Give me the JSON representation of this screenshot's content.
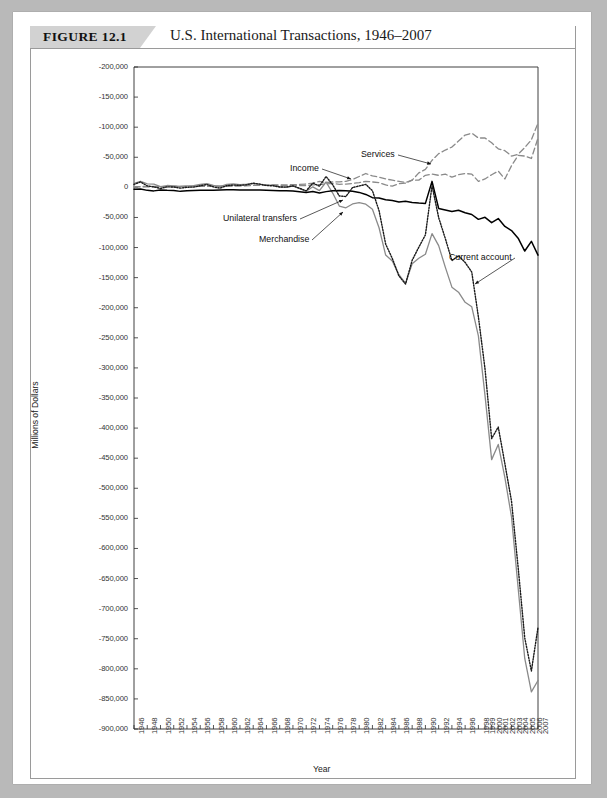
{
  "figure": {
    "tag": "FIGURE 12.1",
    "title": "U.S. International Transactions, 1946–2007"
  },
  "chart_data": {
    "type": "line",
    "title": "U.S. International Transactions, 1946–2007",
    "xlabel": "Year",
    "ylabel": "Millions of Dollars",
    "grid": false,
    "legend_position": "inline-annotations",
    "y_tick_labels": [
      "-200,000",
      "-150,000",
      "-100,000",
      "-50,000",
      "0",
      "-50,000",
      "-100,000",
      "-150,000",
      "-200,000",
      "-250,000",
      "-300,000",
      "-350,000",
      "-400,000",
      "-450,000",
      "-500,000",
      "-550,000",
      "-600,000",
      "-650,000",
      "-700,000",
      "-750,000",
      "-800,000",
      "-850,000",
      "-900,000"
    ],
    "y_tick_values": [
      200000,
      150000,
      100000,
      50000,
      0,
      -50000,
      -100000,
      -150000,
      -200000,
      -250000,
      -300000,
      -350000,
      -400000,
      -450000,
      -500000,
      -550000,
      -600000,
      -650000,
      -700000,
      -750000,
      -800000,
      -850000,
      -900000
    ],
    "ylim": [
      -900000,
      200000
    ],
    "x_tick_labels": [
      "1946",
      "1948",
      "1950",
      "1952",
      "1954",
      "1956",
      "1958",
      "1960",
      "1962",
      "1964",
      "1966",
      "1968",
      "1970",
      "1972",
      "1974",
      "1976",
      "1978",
      "1980",
      "1982",
      "1984",
      "1986",
      "1988",
      "1990",
      "1992",
      "1994",
      "1996",
      "1998",
      "1999",
      "2000",
      "2001",
      "2002",
      "2003",
      "2004",
      "2005",
      "2006",
      "2007"
    ],
    "x": [
      1946,
      1947,
      1948,
      1949,
      1950,
      1951,
      1952,
      1953,
      1954,
      1955,
      1956,
      1957,
      1958,
      1959,
      1960,
      1961,
      1962,
      1963,
      1964,
      1965,
      1966,
      1967,
      1968,
      1969,
      1970,
      1971,
      1972,
      1973,
      1974,
      1975,
      1976,
      1977,
      1978,
      1979,
      1980,
      1981,
      1982,
      1983,
      1984,
      1985,
      1986,
      1987,
      1988,
      1989,
      1990,
      1991,
      1992,
      1993,
      1994,
      1995,
      1996,
      1997,
      1998,
      1999,
      2000,
      2001,
      2002,
      2003,
      2004,
      2005,
      2006,
      2007
    ],
    "series": [
      {
        "name": "Merchandise",
        "style": "solid",
        "color": "#8a8a8a",
        "width": 1.3,
        "values": [
          6697,
          10124,
          5708,
          5339,
          1122,
          3067,
          2611,
          1437,
          2576,
          2897,
          4753,
          6271,
          3312,
          1148,
          4892,
          5571,
          4521,
          5224,
          6801,
          4951,
          3817,
          3800,
          635,
          607,
          2603,
          -2260,
          -6416,
          911,
          -5505,
          8903,
          -9483,
          -31091,
          -33927,
          -27568,
          -25500,
          -28023,
          -36485,
          -67102,
          -112492,
          -122173,
          -145081,
          -159557,
          -126959,
          -117749,
          -111037,
          -76937,
          -96897,
          -132451,
          -165831,
          -174170,
          -191000,
          -198428,
          -246687,
          -346000,
          -452414,
          -427172,
          -482287,
          -547553,
          -665390,
          -782804,
          -838271,
          -819373
        ]
      },
      {
        "name": "Services",
        "style": "dashed",
        "color": "#8a8a8a",
        "width": 1.3,
        "values": [
          1200,
          1400,
          1500,
          1400,
          1200,
          1300,
          1400,
          1500,
          1600,
          1700,
          1800,
          2000,
          2000,
          2100,
          2300,
          2400,
          2700,
          3000,
          3300,
          3500,
          3700,
          3500,
          3400,
          3000,
          2800,
          3000,
          3100,
          4000,
          4700,
          5800,
          6500,
          5000,
          5500,
          6500,
          8000,
          10000,
          9000,
          8000,
          4000,
          2000,
          6000,
          7000,
          12000,
          24000,
          30000,
          45000,
          56000,
          62000,
          67000,
          77000,
          87000,
          90000,
          82000,
          82000,
          74000,
          64000,
          61000,
          52000,
          55000,
          66000,
          79000,
          107000
        ]
      },
      {
        "name": "Income",
        "style": "dashed",
        "color": "#8a8a8a",
        "width": 1.3,
        "values": [
          600,
          700,
          800,
          900,
          1000,
          1100,
          1100,
          1200,
          1300,
          1400,
          1600,
          1800,
          1800,
          1900,
          2100,
          2300,
          2500,
          2800,
          3200,
          3600,
          3800,
          4000,
          4200,
          4200,
          4400,
          5000,
          5600,
          7000,
          10000,
          8000,
          9000,
          9000,
          10000,
          13000,
          18000,
          23000,
          19000,
          17000,
          14000,
          12000,
          10000,
          8000,
          12000,
          12000,
          20000,
          22000,
          20000,
          22000,
          17000,
          21000,
          23000,
          22000,
          10000,
          14000,
          21000,
          27000,
          14000,
          36000,
          53000,
          52000,
          48000,
          82000
        ]
      },
      {
        "name": "Unilateral transfers",
        "style": "solid",
        "color": "#000000",
        "width": 1.5,
        "values": [
          -2991,
          -2722,
          -4973,
          -5849,
          -4537,
          -4954,
          -5113,
          -6657,
          -5642,
          -5086,
          -4990,
          -4763,
          -4647,
          -4422,
          -4062,
          -4127,
          -4277,
          -4392,
          -4240,
          -4583,
          -4955,
          -5294,
          -5629,
          -5735,
          -6156,
          -7402,
          -8544,
          -6913,
          -9249,
          -7075,
          -5686,
          -5226,
          -5788,
          -6593,
          -8349,
          -11702,
          -17075,
          -17718,
          -20612,
          -21998,
          -24132,
          -23265,
          -25274,
          -26169,
          -26654,
          10000,
          -35013,
          -37637,
          -40265,
          -38074,
          -42120,
          -45062,
          -53187,
          -49759,
          -58645,
          -51854,
          -64953,
          -71794,
          -84384,
          -105800,
          -89622,
          -112705
        ]
      },
      {
        "name": "Current account",
        "style": "dotted",
        "color": "#1a1a1a",
        "width": 1.4,
        "values": [
          4885,
          8992,
          2417,
          873,
          -1840,
          884,
          614,
          -1286,
          219,
          430,
          2730,
          4762,
          784,
          -1282,
          2824,
          3822,
          3387,
          4414,
          6823,
          5431,
          3031,
          2583,
          611,
          399,
          2331,
          -1433,
          -5795,
          7140,
          1962,
          18116,
          4295,
          -14335,
          -15143,
          -285,
          2317,
          5030,
          -5536,
          -38691,
          -94344,
          -118155,
          -147177,
          -160655,
          -121153,
          -99487,
          -78968,
          2897,
          -50078,
          -84806,
          -121612,
          -113567,
          -124764,
          -140726,
          -215062,
          -301630,
          -417426,
          -398270,
          -459151,
          -521519,
          -631130,
          -748683,
          -803547,
          -731214
        ]
      }
    ],
    "annotations": [
      {
        "text": "Services",
        "series": "Services"
      },
      {
        "text": "Income",
        "series": "Income"
      },
      {
        "text": "Unilateral transfers",
        "series": "Unilateral transfers"
      },
      {
        "text": "Merchandise",
        "series": "Merchandise"
      },
      {
        "text": "Current account",
        "series": "Current account"
      }
    ]
  }
}
